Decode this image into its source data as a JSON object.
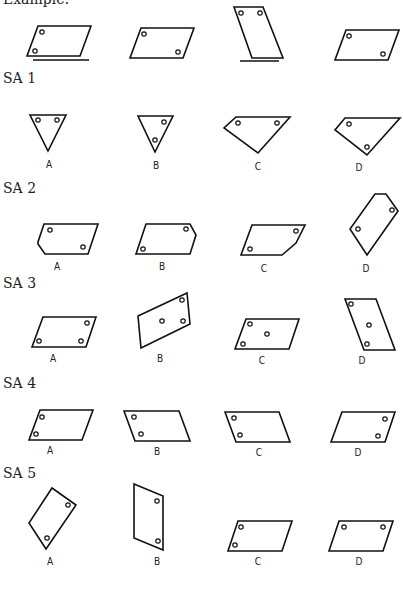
{
  "page": {
    "example_label": "Example:",
    "sections": [
      {
        "id": "SA1",
        "label": "SA 1",
        "options": [
          "A",
          "B",
          "C",
          "D"
        ]
      },
      {
        "id": "SA2",
        "label": "SA 2",
        "options": [
          "A",
          "B",
          "C",
          "D"
        ]
      },
      {
        "id": "SA3",
        "label": "SA 3",
        "options": [
          "A",
          "B",
          "C",
          "D"
        ]
      },
      {
        "id": "SA4",
        "label": "SA 4",
        "options": [
          "A",
          "B",
          "C",
          "D"
        ]
      },
      {
        "id": "SA5",
        "label": "SA 5",
        "options": [
          "A",
          "B",
          "C",
          "D"
        ]
      }
    ]
  }
}
